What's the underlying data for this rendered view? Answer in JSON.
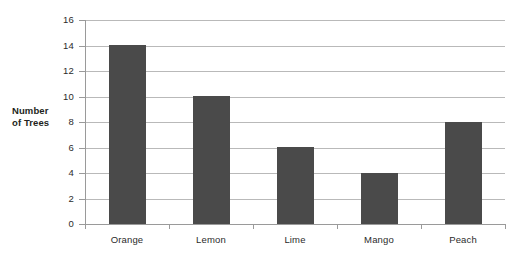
{
  "chart_data": {
    "type": "bar",
    "title": "",
    "subtitle": "",
    "xlabel": "",
    "ylabel": "Number of Trees",
    "ylabel_lines": [
      "Number",
      "of Trees"
    ],
    "categories": [
      "Orange",
      "Lemon",
      "Lime",
      "Mango",
      "Peach"
    ],
    "values": [
      14,
      10,
      6,
      4,
      8
    ],
    "ylim": [
      0,
      16
    ],
    "ytick_step": 2,
    "yticks": [
      16,
      14,
      12,
      10,
      8,
      6,
      4,
      2,
      0
    ],
    "grid": true,
    "grid_axis": "y",
    "legend": false,
    "legend_position": "none",
    "annotations": [],
    "colors": {
      "bar_fill": "#4a4a4a",
      "gridline": "#b9b9b9",
      "axis_line": "#9a9a9a",
      "plot_background": "#ffffff",
      "text": "#2b2b2b",
      "axis_title_text": "#231f20"
    }
  }
}
